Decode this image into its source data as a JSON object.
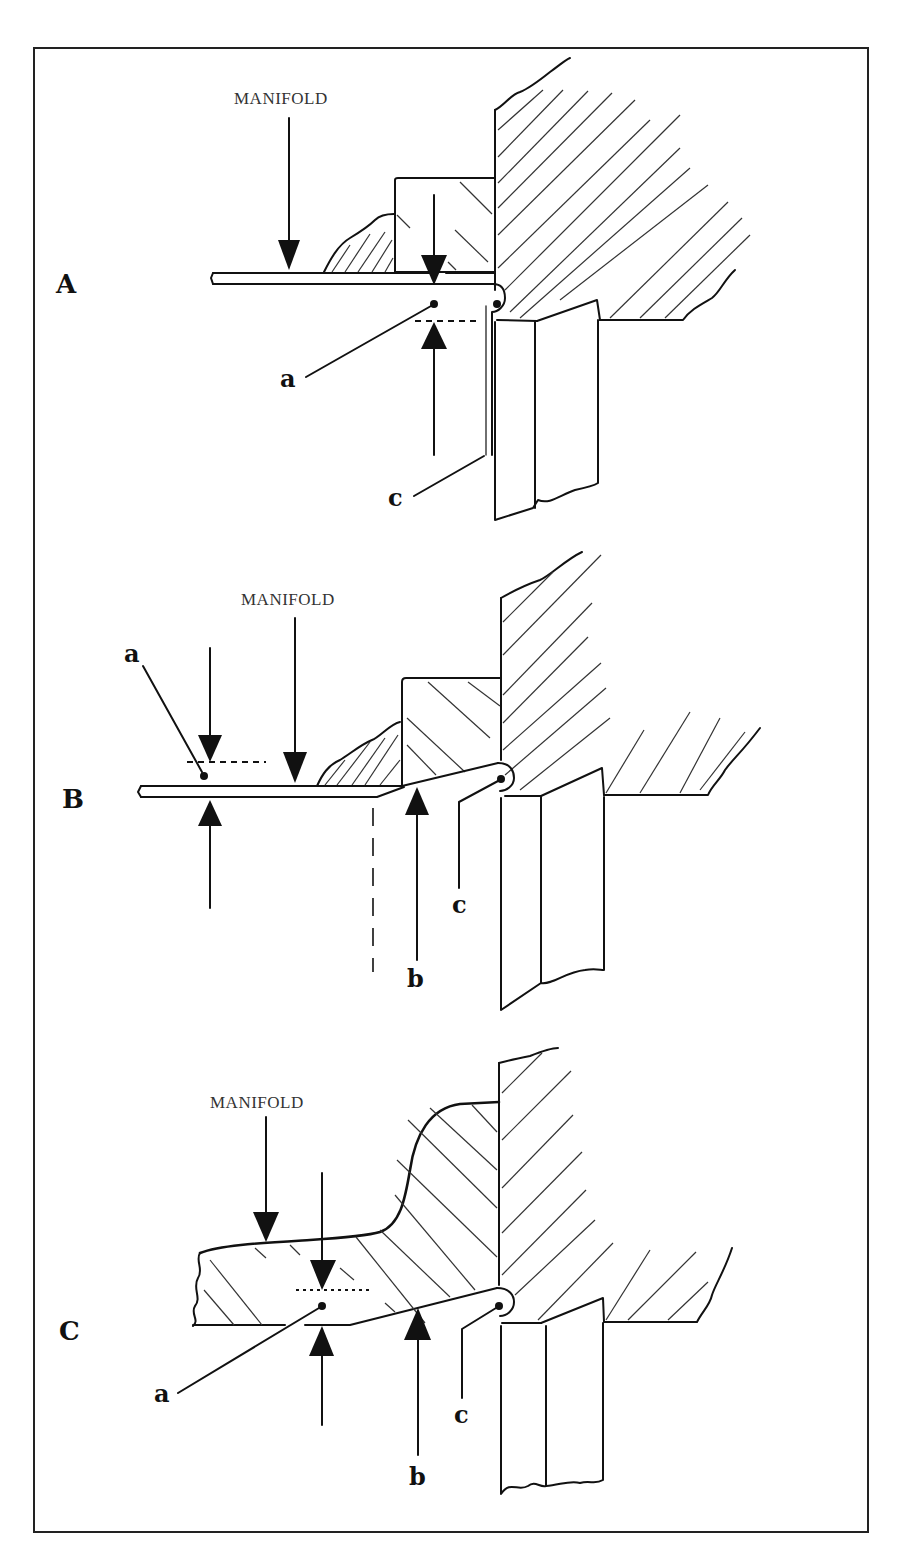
{
  "figure": {
    "panels": [
      {
        "id": "A",
        "label": "A",
        "manifold_label": "MANIFOLD",
        "callouts": {
          "a": "a",
          "c": "c"
        }
      },
      {
        "id": "B",
        "label": "B",
        "manifold_label": "MANIFOLD",
        "callouts": {
          "a": "a",
          "b": "b",
          "c": "c"
        }
      },
      {
        "id": "C",
        "label": "C",
        "manifold_label": "MANIFOLD",
        "callouts": {
          "a": "a",
          "b": "b",
          "c": "c"
        }
      }
    ],
    "colors": {
      "ink": "#111111",
      "background": "#ffffff",
      "frame": "#222222"
    }
  }
}
